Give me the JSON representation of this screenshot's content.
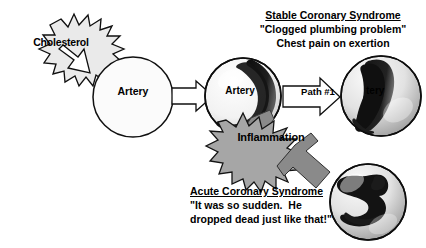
{
  "figure": {
    "title_hidden": "Pathophysiology of coronary syndromes",
    "background_color": "#ffffff",
    "ink_color": "#000000",
    "burst_fill_light": "#e8e8e8",
    "burst_fill_gray": "#a8a8a8",
    "arrow_fill_white": "#ffffff",
    "arrow_fill_gray": "#8f8f8f",
    "plaque_color": "#151515"
  },
  "nodes": {
    "cholesterol": {
      "label": "Cholesterol",
      "shape": "starburst"
    },
    "artery_normal": {
      "label": "Artery",
      "shape": "circle",
      "state": "normal"
    },
    "artery_plaque": {
      "label": "Artery",
      "shape": "circle",
      "state": "plaque"
    },
    "artery_stenotic": {
      "label": "tery",
      "shape": "circle",
      "state": "severely-narrowed"
    },
    "artery_thrombus": {
      "label": "",
      "shape": "circle",
      "state": "thrombosed"
    },
    "inflammation": {
      "label": "Inflammation",
      "shape": "starburst"
    }
  },
  "connectors": {
    "cholesterol_to_artery": {
      "label": "",
      "style": "outlined-block-arrow"
    },
    "artery_to_plaque": {
      "label": "",
      "style": "outlined-block-arrow"
    },
    "path_one": {
      "label": "Path #1",
      "style": "outlined-block-arrow"
    },
    "inflammation_to_thrombus": {
      "label": "",
      "style": "gray-block-arrow"
    },
    "plaque_to_inflammation": {
      "label": "",
      "style": "gray-block-arrow"
    }
  },
  "callouts": {
    "stable": {
      "heading": "Stable Coronary Syndrome",
      "line1": "\"Clogged plumbing problem\"",
      "line2": "Chest pain on exertion"
    },
    "acute": {
      "heading": "Acute Coronary Syndrome",
      "line1": "\"It was so sudden.  He",
      "line2": "dropped dead just like that!\""
    }
  }
}
